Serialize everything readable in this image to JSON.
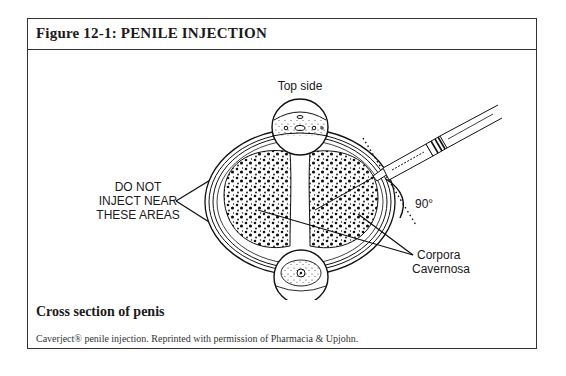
{
  "figure": {
    "title": "Figure 12-1:  PENILE INJECTION",
    "caption": "Cross section of penis",
    "credit": "Caverject® penile injection. Reprinted with permission of Pharmacia & Upjohn."
  },
  "diagram": {
    "labels": {
      "top_side": "Top side",
      "underside": "Underside",
      "warning_line1": "DO NOT",
      "warning_line2": "INJECT NEAR",
      "warning_line3": "THESE AREAS",
      "angle": "90°",
      "corpora_line1": "Corpora",
      "corpora_line2": "Cavernosa"
    }
  }
}
